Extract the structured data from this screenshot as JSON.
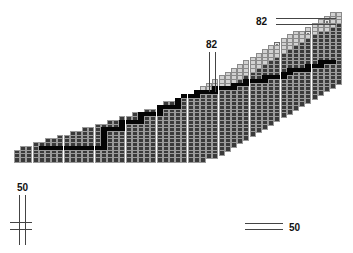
{
  "diagram": {
    "type": "staircase-lattice",
    "cell_size": 6.2,
    "origin": {
      "x": 14,
      "y": 12
    },
    "labels": [
      {
        "id": "label-82-top",
        "text": "82",
        "x": 256,
        "y": 16
      },
      {
        "id": "label-82-mid",
        "text": "82",
        "x": 206,
        "y": 39
      },
      {
        "id": "label-50-left",
        "text": "50",
        "x": 17,
        "y": 182
      },
      {
        "id": "label-50-right",
        "text": "50",
        "x": 289,
        "y": 222
      }
    ],
    "lines": [
      {
        "x": 276,
        "y": 18,
        "w": 60,
        "h": 1
      },
      {
        "x": 276,
        "y": 24,
        "w": 60,
        "h": 1
      },
      {
        "x": 209,
        "y": 52,
        "w": 1,
        "h": 40
      },
      {
        "x": 215,
        "y": 52,
        "w": 1,
        "h": 40
      },
      {
        "x": 19,
        "y": 195,
        "w": 1,
        "h": 50
      },
      {
        "x": 25,
        "y": 195,
        "w": 1,
        "h": 50
      },
      {
        "x": 10,
        "y": 222,
        "w": 22,
        "h": 1
      },
      {
        "x": 10,
        "y": 229,
        "w": 22,
        "h": 1
      },
      {
        "x": 245,
        "y": 223,
        "w": 38,
        "h": 1
      },
      {
        "x": 245,
        "y": 229,
        "w": 38,
        "h": 1
      }
    ],
    "rows": [
      [
        51,
        52
      ],
      [
        50,
        52
      ],
      [
        49,
        52
      ],
      [
        48,
        52
      ],
      [
        47,
        52
      ],
      [
        45,
        52
      ],
      [
        44,
        52
      ],
      [
        43,
        52
      ],
      [
        42,
        52
      ],
      [
        41,
        52
      ],
      [
        40,
        52
      ],
      [
        39,
        52
      ],
      [
        38,
        52
      ],
      [
        37,
        52
      ],
      [
        36,
        52
      ],
      [
        35,
        52
      ],
      [
        34,
        52
      ],
      [
        33,
        52
      ],
      [
        32,
        52
      ],
      [
        31,
        51
      ],
      [
        30,
        50
      ],
      [
        29,
        49
      ],
      [
        27,
        48
      ],
      [
        26,
        47
      ],
      [
        24,
        46
      ],
      [
        23,
        45
      ],
      [
        21,
        44
      ],
      [
        19,
        43
      ],
      [
        17,
        42
      ],
      [
        15,
        41
      ],
      [
        13,
        40
      ],
      [
        11,
        39
      ],
      [
        9,
        38
      ],
      [
        7,
        37
      ],
      [
        5,
        36
      ],
      [
        3,
        35
      ],
      [
        1,
        34
      ],
      [
        0,
        33
      ],
      [
        0,
        32
      ],
      [
        0,
        30
      ]
    ],
    "light_band": {
      "row_offsets_from_start": 4,
      "fade_row": 22
    },
    "black_path": [
      [
        13,
        51
      ],
      [
        13,
        50
      ],
      [
        13,
        49
      ],
      [
        14,
        49
      ],
      [
        14,
        48
      ],
      [
        14,
        47
      ],
      [
        15,
        47
      ],
      [
        15,
        46
      ],
      [
        15,
        45
      ],
      [
        15,
        44
      ],
      [
        16,
        44
      ],
      [
        16,
        43
      ],
      [
        17,
        43
      ],
      [
        17,
        42
      ],
      [
        17,
        41
      ],
      [
        17,
        40
      ],
      [
        18,
        40
      ],
      [
        18,
        39
      ],
      [
        18,
        38
      ],
      [
        18,
        37
      ],
      [
        19,
        37
      ],
      [
        19,
        36
      ],
      [
        19,
        35
      ],
      [
        20,
        35
      ],
      [
        20,
        34
      ],
      [
        20,
        33
      ],
      [
        20,
        32
      ],
      [
        21,
        32
      ],
      [
        21,
        31
      ],
      [
        21,
        30
      ],
      [
        21,
        29
      ],
      [
        22,
        29
      ],
      [
        22,
        28
      ],
      [
        22,
        27
      ],
      [
        22,
        26
      ],
      [
        23,
        26
      ],
      [
        24,
        26
      ],
      [
        25,
        26
      ],
      [
        25,
        25
      ],
      [
        25,
        24
      ],
      [
        25,
        23
      ],
      [
        26,
        23
      ],
      [
        27,
        23
      ],
      [
        27,
        22
      ],
      [
        27,
        21
      ],
      [
        27,
        20
      ],
      [
        28,
        20
      ],
      [
        29,
        20
      ],
      [
        29,
        19
      ],
      [
        29,
        18
      ],
      [
        29,
        17
      ],
      [
        30,
        17
      ],
      [
        31,
        17
      ],
      [
        31,
        16
      ],
      [
        31,
        15
      ],
      [
        31,
        14
      ],
      [
        32,
        14
      ],
      [
        33,
        14
      ],
      [
        34,
        14
      ],
      [
        35,
        14
      ],
      [
        36,
        14
      ],
      [
        36,
        13
      ],
      [
        36,
        12
      ],
      [
        36,
        11
      ],
      [
        36,
        10
      ],
      [
        36,
        9
      ],
      [
        36,
        8
      ],
      [
        36,
        7
      ],
      [
        36,
        6
      ],
      [
        36,
        5
      ],
      [
        36,
        4
      ]
    ],
    "markers": [
      [
        2,
        50
      ],
      [
        5,
        47
      ],
      [
        8,
        42
      ],
      [
        10,
        38
      ],
      [
        12,
        33
      ],
      [
        15,
        28
      ],
      [
        17,
        23
      ],
      [
        19,
        17
      ],
      [
        21,
        13
      ],
      [
        23,
        9
      ],
      [
        26,
        4
      ],
      [
        28,
        2
      ],
      [
        29,
        1
      ],
      [
        30,
        0
      ]
    ]
  }
}
